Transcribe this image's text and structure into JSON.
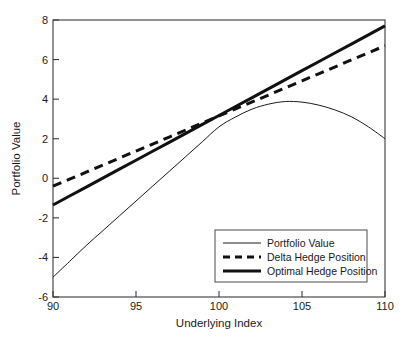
{
  "chart_data": {
    "type": "line",
    "title": "",
    "xlabel": "Underlying Index",
    "ylabel": "Portfolio Value",
    "xlim": [
      90,
      110
    ],
    "ylim": [
      -6,
      8
    ],
    "xticks": [
      90,
      95,
      100,
      105,
      110
    ],
    "yticks": [
      -6,
      -4,
      -2,
      0,
      2,
      4,
      6,
      8
    ],
    "xtick_labels": [
      "90",
      "95",
      "100",
      "105",
      "110"
    ],
    "ytick_labels": [
      "-6",
      "-4",
      "-2",
      "0",
      "2",
      "4",
      "6",
      "8"
    ],
    "grid": false,
    "legend_position": "lower right",
    "x": [
      90,
      91,
      92,
      93,
      94,
      95,
      96,
      97,
      98,
      99,
      100,
      101,
      102,
      103,
      104,
      105,
      106,
      107,
      108,
      109,
      110
    ],
    "series": [
      {
        "name": "Portfolio Value",
        "style": "thin-solid",
        "color": "#1a1a1a",
        "values": [
          -5.0,
          -4.2,
          -3.4,
          -2.65,
          -1.9,
          -1.15,
          -0.4,
          0.35,
          1.1,
          1.85,
          2.6,
          3.1,
          3.5,
          3.75,
          3.88,
          3.85,
          3.7,
          3.45,
          3.1,
          2.6,
          2.0
        ]
      },
      {
        "name": "Delta Hedge Position",
        "style": "thick-dashed",
        "color": "#111111",
        "values": [
          -0.4,
          -0.045,
          0.31,
          0.665,
          1.02,
          1.375,
          1.73,
          2.085,
          2.44,
          2.795,
          3.15,
          3.505,
          3.86,
          4.215,
          4.57,
          4.925,
          5.28,
          5.635,
          5.99,
          6.345,
          6.7
        ]
      },
      {
        "name": "Optimal Hedge Position",
        "style": "thick-solid",
        "color": "#111111",
        "values": [
          -1.35,
          -0.898,
          -0.445,
          0.008,
          0.46,
          0.913,
          1.365,
          1.818,
          2.27,
          2.723,
          3.175,
          3.628,
          4.08,
          4.533,
          4.985,
          5.438,
          5.89,
          6.343,
          6.795,
          7.248,
          7.7
        ]
      }
    ],
    "legend": [
      {
        "label": "Portfolio Value",
        "style": "thin-solid"
      },
      {
        "label": "Delta Hedge Position",
        "style": "thick-dashed"
      },
      {
        "label": "Optimal Hedge Position",
        "style": "thick-solid"
      }
    ]
  }
}
